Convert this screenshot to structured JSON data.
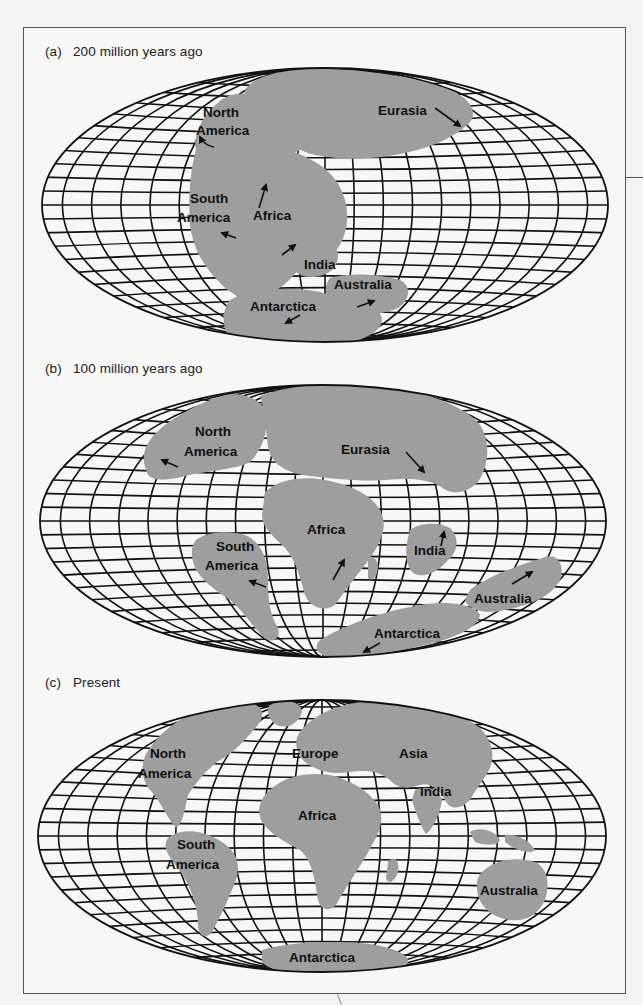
{
  "figure": {
    "panels": [
      {
        "id": "a",
        "letter": "(a)",
        "title": "200 million years ago",
        "labels": [
          {
            "text": "North",
            "x": 203,
            "y": 117
          },
          {
            "text": "America",
            "x": 196,
            "y": 135
          },
          {
            "text": "Eurasia",
            "x": 378,
            "y": 115
          },
          {
            "text": "South",
            "x": 190,
            "y": 203
          },
          {
            "text": "America",
            "x": 177,
            "y": 222
          },
          {
            "text": "Africa",
            "x": 253,
            "y": 220
          },
          {
            "text": "India",
            "x": 304,
            "y": 269
          },
          {
            "text": "Australia",
            "x": 334,
            "y": 289
          },
          {
            "text": "Antarctica",
            "x": 250,
            "y": 311
          }
        ]
      },
      {
        "id": "b",
        "letter": "(b)",
        "title": "100 million years ago",
        "labels": [
          {
            "text": "North",
            "x": 195,
            "y": 436
          },
          {
            "text": "America",
            "x": 184,
            "y": 456
          },
          {
            "text": "Eurasia",
            "x": 341,
            "y": 454
          },
          {
            "text": "Africa",
            "x": 307,
            "y": 534
          },
          {
            "text": "South",
            "x": 216,
            "y": 551
          },
          {
            "text": "America",
            "x": 205,
            "y": 570
          },
          {
            "text": "India",
            "x": 414,
            "y": 555
          },
          {
            "text": "Australia",
            "x": 474,
            "y": 603
          },
          {
            "text": "Antarctica",
            "x": 374,
            "y": 638
          }
        ]
      },
      {
        "id": "c",
        "letter": "(c)",
        "title": "Present",
        "labels": [
          {
            "text": "North",
            "x": 150,
            "y": 758
          },
          {
            "text": "America",
            "x": 138,
            "y": 778
          },
          {
            "text": "Europe",
            "x": 292,
            "y": 758
          },
          {
            "text": "Asia",
            "x": 399,
            "y": 758
          },
          {
            "text": "India",
            "x": 420,
            "y": 796
          },
          {
            "text": "Africa",
            "x": 298,
            "y": 820
          },
          {
            "text": "South",
            "x": 177,
            "y": 849
          },
          {
            "text": "America",
            "x": 166,
            "y": 869
          },
          {
            "text": "Australia",
            "x": 480,
            "y": 895
          },
          {
            "text": "Antarctica",
            "x": 289,
            "y": 962
          }
        ]
      }
    ]
  },
  "colors": {
    "land": "#9e9e9e",
    "grid": "#111111",
    "background": "#f7f7f5",
    "frame": "#555555"
  }
}
